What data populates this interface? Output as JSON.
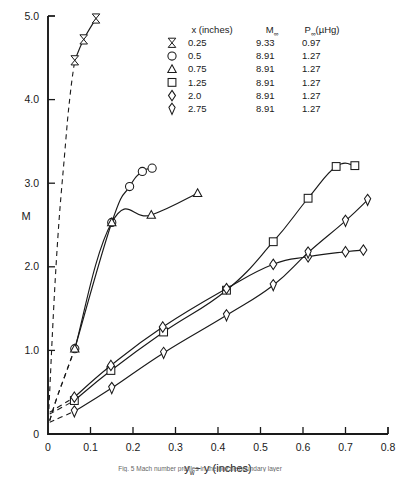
{
  "figure": {
    "caption": "Fig. 5  Mach number profiles in the nozzle boundary layer"
  },
  "axes": {
    "y_label": "M",
    "x_label_main": "y",
    "x_label_sub": "w",
    "x_label_rest": "− y  (inches)",
    "x_label_full": "yw − y (inches)",
    "x_ticks": [
      "0",
      "0.1",
      "0.2",
      "0.3",
      "0.4",
      "0.5",
      "0.6",
      "0.7",
      "0.8"
    ],
    "x_tick_values": [
      0,
      0.1,
      0.2,
      0.3,
      0.4,
      0.5,
      0.6,
      0.7,
      0.8
    ],
    "y_ticks": [
      "0",
      "1.0",
      "2.0",
      "3.0",
      "4.0",
      "5.0"
    ],
    "y_tick_values": [
      0,
      1.0,
      2.0,
      3.0,
      4.0,
      5.0
    ],
    "xlim": [
      0,
      0.8
    ],
    "ylim": [
      0,
      5.0
    ]
  },
  "legend": {
    "headers": {
      "col1": "x (inches)",
      "col2_main": "M",
      "col2_sub": "∞",
      "col3_main": "P",
      "col3_sub": "∞",
      "col3_unit": "(µHg)"
    },
    "rows": [
      {
        "marker": "flag",
        "x": "0.25",
        "m_inf": "9.33",
        "p_inf": "0.97"
      },
      {
        "marker": "circle",
        "x": "0.5",
        "m_inf": "8.91",
        "p_inf": "1.27"
      },
      {
        "marker": "triangle",
        "x": "0.75",
        "m_inf": "8.91",
        "p_inf": "1.27"
      },
      {
        "marker": "square",
        "x": "1.25",
        "m_inf": "8.91",
        "p_inf": "1.27"
      },
      {
        "marker": "diamond",
        "x": "2.0",
        "m_inf": "8.91",
        "p_inf": "1.27"
      },
      {
        "marker": "diamond-tall",
        "x": "2.75",
        "m_inf": "8.91",
        "p_inf": "1.27"
      }
    ]
  },
  "chart_data": {
    "type": "line",
    "title": "",
    "xlabel": "yw − y (inches)",
    "ylabel": "M",
    "xlim": [
      0,
      0.8
    ],
    "ylim": [
      0,
      5.0
    ],
    "grid": false,
    "legend_position": "top-center",
    "series": [
      {
        "name": "x = 0.25 in",
        "marker": "flag",
        "M_inf": 9.33,
        "P_inf": 0.97,
        "points": [
          [
            0.063,
            4.47
          ],
          [
            0.084,
            4.72
          ],
          [
            0.113,
            4.97
          ]
        ],
        "dashed_extension": [
          [
            0.002,
            0.3
          ],
          [
            0.02,
            2.1
          ],
          [
            0.04,
            3.4
          ],
          [
            0.052,
            4.05
          ],
          [
            0.063,
            4.47
          ]
        ]
      },
      {
        "name": "x = 0.5 in",
        "marker": "circle",
        "M_inf": 8.91,
        "P_inf": 1.27,
        "points": [
          [
            0.063,
            1.02
          ],
          [
            0.15,
            2.53
          ],
          [
            0.192,
            2.96
          ],
          [
            0.222,
            3.14
          ],
          [
            0.245,
            3.18
          ]
        ],
        "dashed_extension": [
          [
            0.004,
            0.16
          ],
          [
            0.02,
            0.42
          ],
          [
            0.04,
            0.7
          ],
          [
            0.063,
            1.02
          ]
        ]
      },
      {
        "name": "x = 0.75 in",
        "marker": "triangle",
        "M_inf": 8.91,
        "P_inf": 1.27,
        "points": [
          [
            0.063,
            1.02
          ],
          [
            0.15,
            2.53
          ],
          [
            0.243,
            2.62
          ],
          [
            0.352,
            2.88
          ]
        ],
        "dashed_extension": [
          [
            0.004,
            0.16
          ],
          [
            0.02,
            0.42
          ],
          [
            0.04,
            0.7
          ],
          [
            0.063,
            1.02
          ]
        ]
      },
      {
        "name": "x = 1.25 in",
        "marker": "square",
        "M_inf": 8.91,
        "P_inf": 1.27,
        "points": [
          [
            0.062,
            0.4
          ],
          [
            0.148,
            0.76
          ],
          [
            0.272,
            1.22
          ],
          [
            0.42,
            1.72
          ],
          [
            0.53,
            2.3
          ],
          [
            0.612,
            2.82
          ],
          [
            0.678,
            3.2
          ],
          [
            0.722,
            3.21
          ]
        ],
        "dashed_extension": [
          [
            0.004,
            0.24
          ],
          [
            0.03,
            0.31
          ],
          [
            0.062,
            0.4
          ]
        ]
      },
      {
        "name": "x = 2.0 in",
        "marker": "diamond",
        "M_inf": 8.91,
        "P_inf": 1.27,
        "points": [
          [
            0.062,
            0.44
          ],
          [
            0.148,
            0.82
          ],
          [
            0.27,
            1.28
          ],
          [
            0.42,
            1.74
          ],
          [
            0.53,
            2.03
          ],
          [
            0.612,
            2.12
          ],
          [
            0.7,
            2.18
          ],
          [
            0.742,
            2.2
          ]
        ],
        "dashed_extension": [
          [
            0.004,
            0.26
          ],
          [
            0.03,
            0.34
          ],
          [
            0.062,
            0.44
          ]
        ]
      },
      {
        "name": "x = 2.75 in",
        "marker": "diamond-tall",
        "M_inf": 8.91,
        "P_inf": 1.27,
        "points": [
          [
            0.062,
            0.27
          ],
          [
            0.15,
            0.55
          ],
          [
            0.272,
            0.97
          ],
          [
            0.42,
            1.42
          ],
          [
            0.53,
            1.78
          ],
          [
            0.612,
            2.17
          ],
          [
            0.7,
            2.55
          ],
          [
            0.752,
            2.8
          ]
        ],
        "dashed_extension": [
          [
            0.004,
            0.14
          ],
          [
            0.03,
            0.2
          ],
          [
            0.062,
            0.27
          ]
        ]
      }
    ]
  }
}
